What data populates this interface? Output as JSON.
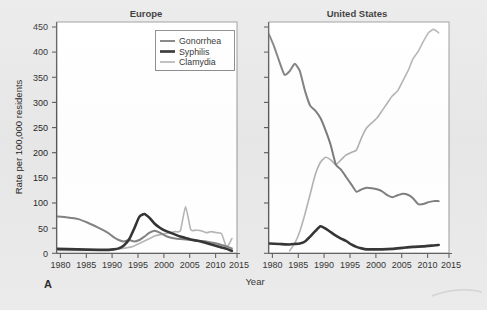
{
  "figure": {
    "panel_letter": "A",
    "background_color": "#e8e8e8",
    "plot_background_color": "#ffffff"
  },
  "axis": {
    "ylabel": "Rate per 100,000 residents",
    "xlabel": "Year",
    "yticks": [
      "0",
      "50",
      "100",
      "150",
      "200",
      "250",
      "300",
      "350",
      "400",
      "450"
    ],
    "xticks": [
      "1980",
      "1985",
      "1990",
      "1995",
      "2000",
      "2005",
      "2010",
      "2015"
    ]
  },
  "legend": {
    "items": [
      {
        "label": "Gonorrhea",
        "color": "#7a7a7a",
        "width": 2.0
      },
      {
        "label": "Syphilis",
        "color": "#262626",
        "width": 2.6
      },
      {
        "label": "Clamydia",
        "color": "#b0b0b0",
        "width": 1.6
      }
    ]
  },
  "chart_data": {
    "type": "line",
    "xlabel": "Year",
    "ylabel": "Rate per 100,000 residents",
    "xlim": [
      1980,
      2015
    ],
    "ylim": [
      0,
      470
    ],
    "grid": false,
    "legend_position": "top-right of left panel",
    "panels": [
      {
        "title": "Europe",
        "series": [
          {
            "name": "Gonorrhea",
            "color": "#7a7a7a",
            "x": [
              1980,
              1982,
              1984,
              1986,
              1988,
              1990,
              1991,
              1992,
              1993,
              1994,
              1995,
              1996,
              1997,
              1998,
              1999,
              2000,
              2001,
              2002,
              2003,
              2004,
              2005,
              2006,
              2007,
              2008,
              2009,
              2010,
              2011,
              2012,
              2013,
              2014
            ],
            "values": [
              75,
              73,
              70,
              62,
              52,
              41,
              33,
              27,
              24,
              27,
              24,
              27,
              34,
              42,
              46,
              42,
              36,
              32,
              30,
              29,
              28,
              27,
              26,
              25,
              24,
              22,
              20,
              17,
              14,
              10
            ]
          },
          {
            "name": "Syphilis",
            "color": "#262626",
            "x": [
              1980,
              1984,
              1988,
              1990,
              1991,
              1992,
              1993,
              1994,
              1995,
              1996,
              1997,
              1998,
              1999,
              2000,
              2001,
              2002,
              2003,
              2004,
              2005,
              2006,
              2007,
              2008,
              2009,
              2010,
              2011,
              2012,
              2013,
              2014
            ],
            "values": [
              9,
              8,
              7,
              7,
              8,
              10,
              16,
              28,
              50,
              74,
              80,
              72,
              60,
              52,
              46,
              42,
              38,
              34,
              31,
              28,
              26,
              24,
              21,
              18,
              15,
              12,
              9,
              5
            ]
          },
          {
            "name": "Clamydia",
            "color": "#b0b0b0",
            "x": [
              1980,
              1985,
              1990,
              1992,
              1994,
              1995,
              1996,
              1997,
              1998,
              1999,
              2000,
              2001,
              2002,
              2003,
              2004,
              2005,
              2006,
              2007,
              2008,
              2009,
              2010,
              2011,
              2012,
              2013,
              2014
            ],
            "values": [
              6,
              6,
              7,
              9,
              12,
              15,
              20,
              25,
              30,
              35,
              38,
              40,
              42,
              44,
              46,
              95,
              48,
              47,
              46,
              42,
              44,
              42,
              40,
              12,
              30
            ]
          }
        ]
      },
      {
        "title": "United States",
        "series": [
          {
            "name": "Gonorrhea",
            "color": "#7a7a7a",
            "x": [
              1980,
              1981,
              1982,
              1983,
              1984,
              1985,
              1986,
              1987,
              1988,
              1989,
              1990,
              1991,
              1992,
              1993,
              1994,
              1995,
              1996,
              1997,
              1998,
              1999,
              2000,
              2001,
              2002,
              2003,
              2004,
              2005,
              2006,
              2007,
              2008,
              2009,
              2010,
              2011,
              2012,
              2013
            ],
            "values": [
              445,
              420,
              390,
              363,
              370,
              385,
              370,
              330,
              300,
              290,
              275,
              250,
              220,
              180,
              170,
              155,
              140,
              125,
              130,
              133,
              132,
              130,
              126,
              118,
              114,
              118,
              121,
              119,
              112,
              100,
              100,
              104,
              106,
              106
            ]
          },
          {
            "name": "Syphilis",
            "color": "#262626",
            "x": [
              1980,
              1982,
              1984,
              1985,
              1986,
              1987,
              1988,
              1989,
              1990,
              1991,
              1992,
              1993,
              1994,
              1995,
              1996,
              1997,
              1998,
              1999,
              2000,
              2002,
              2004,
              2006,
              2008,
              2010,
              2012,
              2013
            ],
            "values": [
              20,
              19,
              18,
              19,
              20,
              24,
              34,
              45,
              55,
              50,
              43,
              36,
              30,
              25,
              18,
              13,
              10,
              8,
              8,
              8,
              9,
              11,
              13,
              14,
              16,
              17
            ]
          },
          {
            "name": "Clamydia",
            "color": "#b0b0b0",
            "x": [
              1984,
              1985,
              1986,
              1987,
              1988,
              1989,
              1990,
              1991,
              1992,
              1993,
              1994,
              1995,
              1996,
              1997,
              1998,
              1999,
              2000,
              2001,
              2002,
              2003,
              2004,
              2005,
              2006,
              2007,
              2008,
              2009,
              2010,
              2011,
              2012,
              2013
            ],
            "values": [
              5,
              20,
              45,
              80,
              120,
              160,
              185,
              195,
              190,
              180,
              190,
              200,
              205,
              210,
              235,
              255,
              265,
              275,
              290,
              305,
              320,
              330,
              350,
              370,
              395,
              410,
              430,
              448,
              455,
              448
            ]
          }
        ]
      }
    ]
  }
}
